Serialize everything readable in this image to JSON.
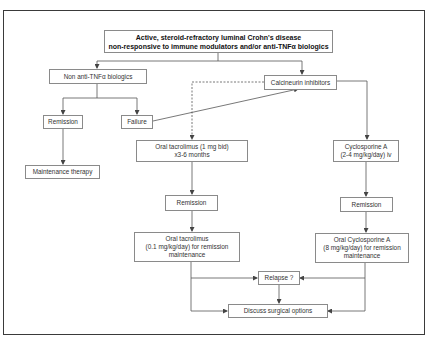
{
  "diagram": {
    "type": "flowchart",
    "nodes": {
      "start": {
        "line1": "Active, steroid-refractory luminal Crohn's disease",
        "line2": "non-responsive to immune modulators and/or anti-TNFα biologics"
      },
      "non_anti_tnf": {
        "label": "Non anti-TNFα biologics"
      },
      "calcineurin": {
        "label": "Calcineurin inhibitors"
      },
      "remission_left": {
        "label": "Remission"
      },
      "failure": {
        "label": "Failure"
      },
      "maintenance_therapy": {
        "label": "Maintenance therapy"
      },
      "oral_tacrolimus_induction": {
        "line1": "Oral tacrolimus (1 mg bid)",
        "line2": "x3-6 months"
      },
      "cyclosporine_iv": {
        "line1": "Cyclosporine A",
        "line2": "(2-4 mg/kg/day) iv"
      },
      "remission_tacrolimus": {
        "label": "Remission"
      },
      "remission_cyclosporine": {
        "label": "Remission"
      },
      "oral_tacrolimus_maintenance": {
        "line1": "Oral tacrolimus",
        "line2": "(0.1 mg/kg/day) for remission",
        "line3": "maintenance"
      },
      "oral_cyclosporine_maintenance": {
        "line1": "Oral Cyclosporine A",
        "line2": "(8 mg/kg/day) for remission",
        "line3": "maintenance"
      },
      "relapse": {
        "label": "Relapse ?"
      },
      "surgery": {
        "label": "Discuss surgical options"
      }
    },
    "edges": [
      {
        "from": "start",
        "to": "non_anti_tnf",
        "style": "solid"
      },
      {
        "from": "start",
        "to": "calcineurin",
        "style": "solid"
      },
      {
        "from": "non_anti_tnf",
        "to": "remission_left",
        "style": "solid"
      },
      {
        "from": "non_anti_tnf",
        "to": "failure",
        "style": "solid"
      },
      {
        "from": "remission_left",
        "to": "maintenance_therapy",
        "style": "solid"
      },
      {
        "from": "failure",
        "to": "calcineurin",
        "style": "solid"
      },
      {
        "from": "calcineurin",
        "to": "oral_tacrolimus_induction",
        "style": "dashed"
      },
      {
        "from": "calcineurin",
        "to": "cyclosporine_iv",
        "style": "solid"
      },
      {
        "from": "oral_tacrolimus_induction",
        "to": "remission_tacrolimus",
        "style": "solid"
      },
      {
        "from": "cyclosporine_iv",
        "to": "remission_cyclosporine",
        "style": "solid"
      },
      {
        "from": "remission_tacrolimus",
        "to": "oral_tacrolimus_maintenance",
        "style": "solid"
      },
      {
        "from": "remission_cyclosporine",
        "to": "oral_cyclosporine_maintenance",
        "style": "solid"
      },
      {
        "from": "oral_tacrolimus_maintenance",
        "to": "relapse",
        "style": "solid"
      },
      {
        "from": "oral_cyclosporine_maintenance",
        "to": "relapse",
        "style": "solid"
      },
      {
        "from": "oral_tacrolimus_maintenance",
        "to": "surgery",
        "style": "solid"
      },
      {
        "from": "oral_cyclosporine_maintenance",
        "to": "surgery",
        "style": "solid"
      },
      {
        "from": "relapse",
        "to": "surgery",
        "style": "solid"
      }
    ]
  },
  "colors": {
    "frame": "#3a3a3a",
    "box_border": "#8a8a8a",
    "edge": "#555555",
    "text": "#333333"
  }
}
